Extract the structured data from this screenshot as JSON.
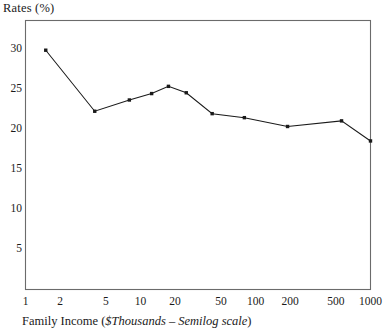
{
  "chart_data": {
    "type": "line",
    "title": "",
    "ylabel": "Rates (%)",
    "xlabel_parts": {
      "plain1": "Family Income (",
      "italic1": "$Thousands – Semilog scale",
      "plain2": ")"
    },
    "xlabel": "Family Income ($Thousands – Semilog scale)",
    "xscale": "log",
    "yscale": "linear",
    "grid": false,
    "legend": false,
    "xlim": [
      1,
      1000
    ],
    "ylim": [
      0,
      33.5
    ],
    "xticks": [
      1,
      2,
      5,
      10,
      20,
      50,
      100,
      200,
      500,
      1000
    ],
    "xticklabels": [
      "1",
      "2",
      "5",
      "10",
      "20",
      "50",
      "100",
      "200",
      "500",
      "1000"
    ],
    "yticks": [
      5,
      10,
      15,
      20,
      25,
      30
    ],
    "yticklabels": [
      "5",
      "10",
      "15",
      "20",
      "25",
      "30"
    ],
    "marker": "square",
    "line_color": "#1a1a1a",
    "x": [
      1.5,
      4,
      8,
      12.5,
      17.5,
      25,
      42,
      80,
      190,
      560,
      1000
    ],
    "y": [
      29.8,
      22.2,
      23.6,
      24.4,
      25.3,
      24.5,
      21.9,
      21.4,
      20.3,
      21.0,
      18.5
    ],
    "points": [
      {
        "income": 1.5,
        "rate": 29.8
      },
      {
        "income": 4,
        "rate": 22.2
      },
      {
        "income": 8,
        "rate": 23.6
      },
      {
        "income": 12.5,
        "rate": 24.4
      },
      {
        "income": 17.5,
        "rate": 25.3
      },
      {
        "income": 25,
        "rate": 24.5
      },
      {
        "income": 42,
        "rate": 21.9
      },
      {
        "income": 80,
        "rate": 21.4
      },
      {
        "income": 190,
        "rate": 20.3
      },
      {
        "income": 560,
        "rate": 21.0
      },
      {
        "income": 1000,
        "rate": 18.5
      }
    ]
  },
  "axes": {
    "frame_color": "#6b6b6b",
    "text_color": "#1a1a1a"
  }
}
